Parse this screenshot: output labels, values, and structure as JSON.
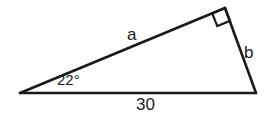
{
  "figure": {
    "type": "right-triangle-diagram",
    "background_color": "#ffffff",
    "stroke_color": "#1a1a1a",
    "labels": {
      "side_upper": "a",
      "side_right": "b",
      "side_base": "30",
      "angle_left": "22°"
    },
    "markers": {
      "right_angle": "right-angle-square"
    },
    "geometry": {
      "vertex_left": [
        20,
        93
      ],
      "vertex_top_right": [
        225,
        8
      ],
      "vertex_bottom_right": [
        256,
        93
      ]
    }
  }
}
